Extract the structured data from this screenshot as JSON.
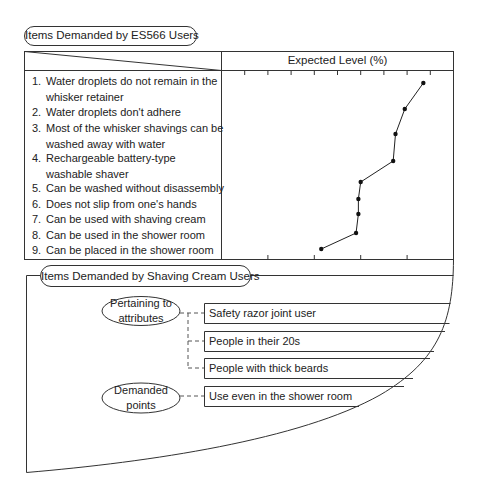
{
  "top_section": {
    "title": "Items Demanded by ES566 Users",
    "column_header": "Expected Level (%)",
    "items": [
      {
        "num": "1.",
        "lines": [
          "Water droplets do not remain in the",
          "whisker retainer"
        ]
      },
      {
        "num": "2.",
        "lines": [
          "Water droplets don't adhere"
        ]
      },
      {
        "num": "3.",
        "lines": [
          "Most of the whisker shavings can be",
          "washed away with water"
        ]
      },
      {
        "num": "4.",
        "lines": [
          "Rechargeable battery-type",
          "washable shaver"
        ]
      },
      {
        "num": "5.",
        "lines": [
          "Can be washed without disassembly"
        ]
      },
      {
        "num": "6.",
        "lines": [
          "Does not slip from one's hands"
        ]
      },
      {
        "num": "7.",
        "lines": [
          "Can be used with shaving cream"
        ]
      },
      {
        "num": "8.",
        "lines": [
          "Can be used in the shower room"
        ]
      },
      {
        "num": "9.",
        "lines": [
          "Can be placed in the shower room"
        ]
      }
    ]
  },
  "chart_data": {
    "type": "line",
    "title": "Expected Level (%)",
    "xlabel": "Expected Level (%)",
    "ylabel": "",
    "orientation": "horizontal-values",
    "categories": [
      "Water droplets do not remain in the whisker retainer",
      "Water droplets don't adhere",
      "Most of the whisker shavings can be washed away with water",
      "Rechargeable battery-type washable shaver",
      "Can be washed without disassembly",
      "Does not slip from one's hands",
      "Can be used with shaving cream",
      "Can be used in the shower room",
      "Can be placed in the shower room"
    ],
    "values": [
      87,
      79,
      75,
      74,
      60,
      59,
      59,
      58,
      43
    ],
    "xlim": [
      0,
      100
    ],
    "top_ticks": [
      10,
      20,
      30,
      40,
      50,
      60,
      70,
      80,
      90
    ],
    "bottom_ticks": [
      20,
      40,
      60,
      80
    ],
    "tick_labels_shown": false,
    "grid": false,
    "legend": null
  },
  "bottom_section": {
    "title": "Items Demanded by Shaving Cream Users",
    "groups": [
      {
        "label_lines": [
          "Pertaining to",
          "attributes"
        ],
        "items": [
          "Safety razor joint user",
          "People in their 20s",
          "People with thick beards"
        ]
      },
      {
        "label_lines": [
          "Demanded",
          "points"
        ],
        "items": [
          "Use even in the shower room"
        ]
      }
    ]
  }
}
